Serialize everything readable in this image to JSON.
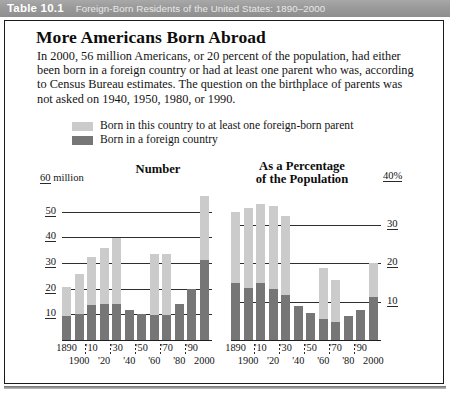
{
  "header": {
    "table_label": "Table 10.1",
    "title": "Foreign-Born Residents of the United States: 1890–2000"
  },
  "headline": "More Americans Born Abroad",
  "body": "In 2000, 56 million Americans, or 20 percent of the population, had either been born in a foreign country or had at least one parent who was, according to Census Bureau estimates. The question on the birthplace of parents was not asked on 1940, 1950, 1980, or 1990.",
  "legend": {
    "items": [
      {
        "label": "Born in this country to at least one foreign-born parent",
        "color": "#cbcbcb"
      },
      {
        "label": "Born in a foreign country",
        "color": "#767676"
      }
    ]
  },
  "colors": {
    "native_born_parent": "#cbcbcb",
    "foreign_born": "#767676",
    "axis": "#2a2a2a",
    "header_bar": "#9a9a9a",
    "frame": "#1b1b1b"
  },
  "chart_data": [
    {
      "type": "bar",
      "id": "number",
      "title": "Number",
      "axis_unit_label": "60 million",
      "axis_unit_value": "60",
      "axis_unit_suffix": " million",
      "ylabel": "millions of people",
      "ylim": [
        0,
        60
      ],
      "yticks": [
        50,
        40,
        30,
        20,
        10
      ],
      "grid": true,
      "legend_position": "top",
      "categories": [
        "1890",
        "1900",
        "'10",
        "'20",
        "'30",
        "'40",
        "'50",
        "'60",
        "'70",
        "'80",
        "'90",
        "2000"
      ],
      "xlabels_top": [
        "1890",
        "'10",
        "'30",
        "'50",
        "'70",
        "'90"
      ],
      "xlabels_bottom": [
        "1900",
        "'20",
        "'40",
        "'60",
        "'80",
        "2000"
      ],
      "series": [
        {
          "name": "Born in a foreign country",
          "color": "#767676",
          "values": [
            9.2,
            10.3,
            13.5,
            14.0,
            14.2,
            11.6,
            10.3,
            9.7,
            9.6,
            14.1,
            19.8,
            31.1
          ]
        },
        {
          "name": "Born in this country to at least one foreign-born parent",
          "color": "#cbcbcb",
          "values": [
            11.5,
            15.6,
            18.9,
            22.0,
            25.4,
            0.0,
            0.0,
            23.8,
            23.8,
            0.0,
            0.0,
            24.9
          ]
        }
      ],
      "totals": [
        20.7,
        25.9,
        32.4,
        36.0,
        39.6,
        11.6,
        10.3,
        33.5,
        33.4,
        14.1,
        19.8,
        56.0
      ]
    },
    {
      "type": "bar",
      "id": "percentage",
      "title": "As a Percentage\nof the Population",
      "title_line1": "As a Percentage",
      "title_line2": "of the Population",
      "axis_unit_label": "40%",
      "axis_unit_value": "40",
      "axis_unit_suffix": "%",
      "ylabel": "percent of population",
      "ylim": [
        0,
        40
      ],
      "yticks": [
        30,
        20,
        10
      ],
      "grid": true,
      "legend_position": "top",
      "categories": [
        "1890",
        "1900",
        "'10",
        "'20",
        "'30",
        "'40",
        "'50",
        "'60",
        "'70",
        "'80",
        "'90",
        "2000"
      ],
      "xlabels_top": [
        "1890",
        "'10",
        "'30",
        "'50",
        "'70",
        "'90"
      ],
      "xlabels_bottom": [
        "1900",
        "'20",
        "'40",
        "'60",
        "'80",
        "2000"
      ],
      "series": [
        {
          "name": "Born in a foreign country",
          "color": "#767676",
          "values": [
            14.8,
            13.6,
            14.7,
            13.2,
            11.6,
            8.8,
            6.9,
            5.4,
            4.7,
            6.2,
            7.9,
            11.1
          ]
        },
        {
          "name": "Born in this country to at least one foreign-born parent",
          "color": "#cbcbcb",
          "values": [
            18.4,
            20.6,
            20.5,
            21.5,
            20.5,
            0.0,
            0.0,
            13.2,
            11.0,
            0.0,
            0.0,
            8.9
          ]
        }
      ],
      "totals": [
        33.2,
        34.2,
        35.2,
        34.7,
        32.1,
        8.8,
        6.9,
        18.6,
        15.7,
        6.2,
        7.9,
        20.0
      ]
    }
  ]
}
